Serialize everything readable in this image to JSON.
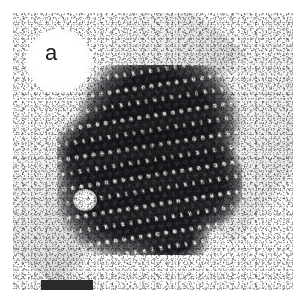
{
  "figure": {
    "kind": "transmission-electron-micrograph",
    "panel_label": "a",
    "caption_text": "",
    "background_color": "#ffffff",
    "plate_color": "#fbfbfa",
    "stain_color": "#2a2a2c"
  },
  "micrograph": {
    "technique": "negative-stain transmission electron microscopy",
    "subject": "two-dimensional crystalline array of icosahedral virus-like particles",
    "plate": {
      "left": 13,
      "top": 13,
      "width": 280,
      "height": 277
    },
    "features": {
      "array_label": "particle crystal array",
      "array_bounds": {
        "left": 44,
        "top": 52,
        "width": 185,
        "height": 190
      },
      "stain_hole_label": "bright stain-filled vacancy",
      "film_edge_label": "carbon support film edge"
    }
  },
  "label": {
    "text": "a",
    "halo_label": "white label halo"
  },
  "scale_bar": {
    "caption": "",
    "length_px": 52,
    "thickness_px": 10,
    "color": "#2a2a2c"
  },
  "lattice": {
    "motif": "rosette of elongated dark stain-excluded lens shapes",
    "symmetry": "hexagonal close packed",
    "spacing_px": 17,
    "unit_count_approx": 120,
    "particle_dark": "#232326",
    "particle_mid": "#4a4a4f",
    "particle_light": "#f2f2ef"
  }
}
